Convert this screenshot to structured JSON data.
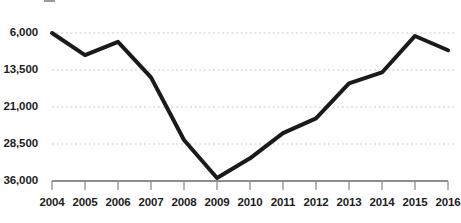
{
  "chart_data": {
    "type": "line",
    "title": "",
    "subtitle": "",
    "xlabel": "",
    "ylabel": "",
    "categories": [
      "2004",
      "2005",
      "2006",
      "2007",
      "2008",
      "2009",
      "2010",
      "2011",
      "2012",
      "2013",
      "2014",
      "2015",
      "2016"
    ],
    "values": [
      36000,
      31500,
      34200,
      27000,
      14300,
      6600,
      10600,
      15700,
      18700,
      25800,
      28000,
      35400,
      32500
    ],
    "series": [
      {
        "name": "",
        "values": [
          36000,
          31500,
          34200,
          27000,
          14300,
          6600,
          10600,
          15700,
          18700,
          25800,
          28000,
          35400,
          32500
        ]
      }
    ],
    "ylim": [
      6000,
      36000
    ],
    "yticks": [
      6000,
      13500,
      21000,
      28500,
      36000
    ],
    "ytick_labels": [
      "6,000",
      "13,500",
      "21,000",
      "28,500",
      "36,000"
    ],
    "xtick_labels": [
      "2004",
      "2005",
      "2006",
      "2007",
      "2008",
      "2009",
      "2010",
      "2011",
      "2012",
      "2013",
      "2014",
      "2015",
      "2016"
    ],
    "grid": true,
    "grid_style": "dotted-horizontal",
    "legend": "none",
    "line_color": "#1a1a1a",
    "line_width": 4,
    "grid_color": "#c9c9d4",
    "axis_color": "#8e8e8e",
    "background": "#ffffff",
    "annotations": []
  },
  "chart": {
    "title_text": "",
    "title_visible": false
  },
  "axes": {
    "y_tick_labels": [
      "36,000",
      "28,500",
      "21,000",
      "13,500",
      "6,000"
    ],
    "x_tick_labels": [
      "2004",
      "2005",
      "2006",
      "2007",
      "2008",
      "2009",
      "2010",
      "2011",
      "2012",
      "2013",
      "2014",
      "2015",
      "2016"
    ]
  }
}
